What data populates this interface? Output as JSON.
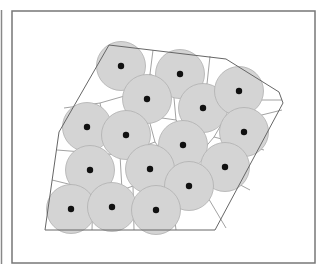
{
  "figure": {
    "colors": {
      "frame": "#777777",
      "polygon": "#666666",
      "voronoi": "#8a8a8a",
      "circle_fill": "#d4d4d4",
      "circle_stroke": "#b0b0b0",
      "center": "#111111"
    },
    "polygon": [
      [
        109,
        45
      ],
      [
        226,
        59
      ],
      [
        279,
        92
      ],
      [
        283,
        103
      ],
      [
        215,
        230
      ],
      [
        45,
        230
      ],
      [
        59,
        132
      ]
    ],
    "circles": [
      {
        "id": 1,
        "cx": 121,
        "cy": 66
      },
      {
        "id": 2,
        "cx": 180,
        "cy": 74
      },
      {
        "id": 3,
        "cx": 147,
        "cy": 99
      },
      {
        "id": 4,
        "cx": 203,
        "cy": 108
      },
      {
        "id": 5,
        "cx": 239,
        "cy": 91
      },
      {
        "id": 6,
        "cx": 87,
        "cy": 127
      },
      {
        "id": 7,
        "cx": 126,
        "cy": 135
      },
      {
        "id": 8,
        "cx": 183,
        "cy": 145
      },
      {
        "id": 9,
        "cx": 244,
        "cy": 132
      },
      {
        "id": 10,
        "cx": 90,
        "cy": 170
      },
      {
        "id": 11,
        "cx": 150,
        "cy": 169
      },
      {
        "id": 12,
        "cx": 225,
        "cy": 167
      },
      {
        "id": 13,
        "cx": 189,
        "cy": 186
      },
      {
        "id": 14,
        "cx": 71,
        "cy": 209
      },
      {
        "id": 15,
        "cx": 112,
        "cy": 207
      },
      {
        "id": 16,
        "cx": 156,
        "cy": 210
      }
    ],
    "voronoi_edges": [
      [
        [
          153,
          50
        ],
        [
          150,
          74
        ]
      ],
      [
        [
          150,
          74
        ],
        [
          128,
          95
        ]
      ],
      [
        [
          150,
          74
        ],
        [
          168,
          86
        ]
      ],
      [
        [
          168,
          86
        ],
        [
          174,
          98
        ]
      ],
      [
        [
          210,
          56
        ],
        [
          207,
          84
        ]
      ],
      [
        [
          207,
          84
        ],
        [
          178,
          98
        ]
      ],
      [
        [
          207,
          84
        ],
        [
          222,
          100
        ]
      ],
      [
        [
          222,
          100
        ],
        [
          282,
          100
        ]
      ],
      [
        [
          222,
          100
        ],
        [
          221,
          125
        ]
      ],
      [
        [
          221,
          125
        ],
        [
          282,
          110
        ]
      ],
      [
        [
          221,
          125
        ],
        [
          214,
          137
        ]
      ],
      [
        [
          214,
          137
        ],
        [
          264,
          150
        ]
      ],
      [
        [
          214,
          137
        ],
        [
          203,
          150
        ]
      ],
      [
        [
          174,
          98
        ],
        [
          176,
          120
        ]
      ],
      [
        [
          176,
          120
        ],
        [
          148,
          116
        ]
      ],
      [
        [
          176,
          120
        ],
        [
          203,
          150
        ]
      ],
      [
        [
          128,
          95
        ],
        [
          100,
          103
        ]
      ],
      [
        [
          100,
          103
        ],
        [
          64,
          108
        ]
      ],
      [
        [
          100,
          103
        ],
        [
          108,
          140
        ]
      ],
      [
        [
          108,
          140
        ],
        [
          148,
          116
        ]
      ],
      [
        [
          148,
          116
        ],
        [
          155,
          142
        ]
      ],
      [
        [
          155,
          142
        ],
        [
          168,
          160
        ]
      ],
      [
        [
          108,
          140
        ],
        [
          120,
          155
        ]
      ],
      [
        [
          120,
          155
        ],
        [
          155,
          142
        ]
      ],
      [
        [
          120,
          155
        ],
        [
          57,
          150
        ]
      ],
      [
        [
          120,
          155
        ],
        [
          122,
          190
        ]
      ],
      [
        [
          203,
          150
        ],
        [
          168,
          160
        ]
      ],
      [
        [
          168,
          160
        ],
        [
          170,
          178
        ]
      ],
      [
        [
          203,
          150
        ],
        [
          208,
          168
        ]
      ],
      [
        [
          208,
          168
        ],
        [
          250,
          190
        ]
      ],
      [
        [
          208,
          168
        ],
        [
          207,
          196
        ]
      ],
      [
        [
          207,
          196
        ],
        [
          226,
          228
        ]
      ],
      [
        [
          170,
          178
        ],
        [
          207,
          196
        ]
      ],
      [
        [
          170,
          178
        ],
        [
          133,
          186
        ]
      ],
      [
        [
          133,
          186
        ],
        [
          122,
          190
        ]
      ],
      [
        [
          122,
          190
        ],
        [
          93,
          190
        ]
      ],
      [
        [
          93,
          190
        ],
        [
          52,
          180
        ]
      ],
      [
        [
          93,
          190
        ],
        [
          92,
          230
        ]
      ],
      [
        [
          133,
          186
        ],
        [
          134,
          230
        ]
      ],
      [
        [
          170,
          178
        ],
        [
          176,
          230
        ]
      ]
    ]
  }
}
